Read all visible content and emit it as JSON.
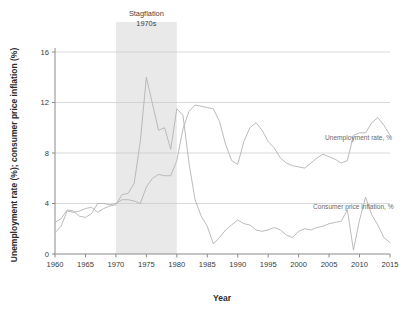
{
  "chart_data": {
    "type": "line",
    "title": "",
    "xlabel": "Year",
    "ylabel": "Unemployment rate (%); consumer price inflation (%)",
    "xlim": [
      1960,
      2015
    ],
    "ylim": [
      0,
      16
    ],
    "xticks": [
      "1960",
      "1965",
      "1970",
      "1975",
      "1980",
      "1985",
      "1990",
      "1995",
      "2000",
      "2005",
      "2010",
      "2015"
    ],
    "yticks": [
      "0",
      "4",
      "8",
      "12",
      "16"
    ],
    "grid": "horizontal",
    "legend_position": "inline-right",
    "annotations": [
      {
        "name": "stagflation",
        "line1": "Stagflation",
        "line2": "1970s",
        "span": [
          1970,
          1980
        ]
      }
    ],
    "x": [
      1960,
      1961,
      1962,
      1963,
      1964,
      1965,
      1966,
      1967,
      1968,
      1969,
      1970,
      1971,
      1972,
      1973,
      1974,
      1975,
      1976,
      1977,
      1978,
      1979,
      1980,
      1981,
      1982,
      1983,
      1984,
      1985,
      1986,
      1987,
      1988,
      1989,
      1990,
      1991,
      1992,
      1993,
      1994,
      1995,
      1996,
      1997,
      1998,
      1999,
      2000,
      2001,
      2002,
      2003,
      2004,
      2005,
      2006,
      2007,
      2008,
      2009,
      2010,
      2011,
      2012,
      2013,
      2014,
      2015
    ],
    "series": [
      {
        "name": "Consumer price inflation, %",
        "label": "Consumer price inflation, %",
        "color": "#b3b3b3",
        "values": [
          1.7,
          2.2,
          3.4,
          3.3,
          3.4,
          3.6,
          3.7,
          3.3,
          3.6,
          3.8,
          3.9,
          4.7,
          4.8,
          5.6,
          8.9,
          14.0,
          11.9,
          9.8,
          10.0,
          8.3,
          11.5,
          11.0,
          7.2,
          4.3,
          3.0,
          2.2,
          0.8,
          1.3,
          1.9,
          2.3,
          2.7,
          2.4,
          2.3,
          1.9,
          1.8,
          1.9,
          2.1,
          1.9,
          1.5,
          1.3,
          1.8,
          2.0,
          1.9,
          2.1,
          2.2,
          2.4,
          2.5,
          2.6,
          3.5,
          0.3,
          2.7,
          4.5,
          3.1,
          2.3,
          1.3,
          0.9
        ]
      },
      {
        "name": "Unemployment rate, %",
        "label": "Unemployment rate, %",
        "color": "#b3b3b3",
        "values": [
          2.5,
          2.8,
          3.5,
          3.4,
          3.0,
          2.9,
          3.2,
          4.0,
          4.0,
          3.9,
          4.0,
          4.3,
          4.3,
          4.2,
          4.0,
          5.3,
          6.0,
          6.3,
          6.2,
          6.2,
          7.4,
          9.9,
          11.3,
          11.8,
          11.7,
          11.6,
          11.5,
          10.5,
          8.7,
          7.4,
          7.1,
          8.9,
          10.0,
          10.4,
          9.8,
          8.9,
          8.4,
          7.6,
          7.2,
          7.0,
          6.9,
          6.8,
          7.2,
          7.6,
          7.9,
          7.7,
          7.5,
          7.2,
          7.4,
          9.4,
          9.6,
          9.6,
          10.4,
          10.8,
          10.2,
          9.4
        ]
      }
    ]
  }
}
